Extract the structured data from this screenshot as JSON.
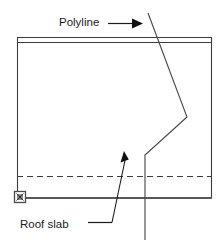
{
  "figure": {
    "background_color": "#ffffff",
    "line_color": "#3c3c3c",
    "heavy_line_color": "#585858",
    "text_color": "#1a1a1a",
    "width": 224,
    "height": 249
  },
  "annotations": {
    "polyline": {
      "label": "Polyline",
      "label_x": 59,
      "label_y": 26,
      "leader_start_x": 108,
      "leader_start_y": 23,
      "leader_end_x": 143,
      "leader_end_y": 23,
      "arrow_direction": "right"
    },
    "roof_slab": {
      "label": "Roof slab",
      "label_x": 20,
      "label_y": 228,
      "leader_start_x": 88,
      "leader_start_y": 223,
      "leader_mid_x": 112,
      "leader_mid_y": 223,
      "leader_end_x": 124,
      "leader_end_y": 153,
      "arrow_direction": "up-right"
    }
  },
  "geometry": {
    "slab_band": {
      "name": "roof-slab-top-band",
      "x1": 17,
      "y1": 37,
      "x2": 212,
      "y2": 42
    },
    "left_edge": {
      "x": 17,
      "y1": 37,
      "y2": 199
    },
    "right_edge": {
      "x": 212,
      "y1": 37,
      "y2": 199
    },
    "hidden_dashed_line": {
      "x1": 17,
      "x2": 212,
      "y": 176,
      "dash": "6 4"
    },
    "bottom_heavy_line": {
      "x1": 16,
      "x2": 212,
      "y": 198
    },
    "grip_marker": {
      "name": "selection-grip",
      "cx": 20,
      "cy": 197,
      "size": 11
    },
    "polyline_path": {
      "points": "148,13 187,117 145,155 145,240",
      "vertices": [
        {
          "x": 148,
          "y": 13
        },
        {
          "x": 187,
          "y": 117
        },
        {
          "x": 145,
          "y": 155
        },
        {
          "x": 145,
          "y": 240
        }
      ]
    }
  }
}
